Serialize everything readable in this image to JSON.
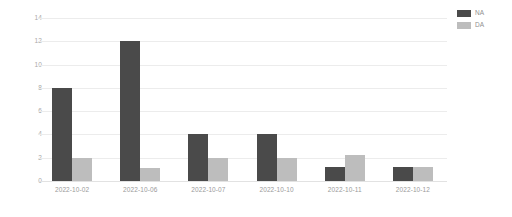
{
  "chart_data": {
    "type": "bar",
    "title": "",
    "subtitle": "",
    "xlabel": "",
    "ylabel": "",
    "categories": [
      "2022-10-02",
      "2022-10-06",
      "2022-10-07",
      "2022-10-10",
      "2022-10-11",
      "2022-10-12"
    ],
    "series": [
      {
        "name": "NA",
        "color": "#4a4a4a",
        "values": [
          8,
          12,
          4,
          4,
          1.2,
          1.2
        ]
      },
      {
        "name": "DA",
        "color": "#bdbdbd",
        "values": [
          2,
          1.1,
          2,
          2,
          2.2,
          1.2
        ]
      }
    ],
    "ylim": [
      0,
      14
    ],
    "yticks": [
      0,
      2,
      4,
      6,
      8,
      10,
      12,
      14
    ],
    "ytick_labels": [
      "0",
      "2",
      "4",
      "6",
      "8",
      "10",
      "12",
      "14"
    ],
    "grid": "horizontal",
    "legend_position": "top-right",
    "legend_note": "labels clipped at right edge of image",
    "background": "#ffffff",
    "grid_color": "#ececec",
    "axis_text_color": "#9a9a9a"
  }
}
